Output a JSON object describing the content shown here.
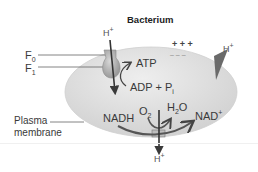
{
  "title": "Bacterium",
  "labels": {
    "f0": {
      "base": "F",
      "sub": "0"
    },
    "f1": {
      "base": "F",
      "sub": "1"
    },
    "plasma_membrane_line1": "Plasma",
    "plasma_membrane_line2": "membrane",
    "h_top": {
      "base": "H",
      "sup": "+"
    },
    "h_right": {
      "base": "H",
      "sup": "+"
    },
    "h_bottom": {
      "base": "H",
      "sup": "+"
    },
    "atp": "ATP",
    "adp_pi": {
      "base": "ADP + P",
      "sub": "i"
    },
    "nadh": "NADH",
    "o2": {
      "base": "O",
      "sub": "2"
    },
    "h2o": {
      "base": "H",
      "sub": "2",
      "tail": "O"
    },
    "nad": {
      "base": "NAD",
      "sup": "+"
    },
    "plus_charges": "+ + +",
    "minus_charges": "– – –"
  },
  "colors": {
    "cell_fill": "#dcdcdc",
    "cell_highlight": "#eeeeee",
    "arrow": "#3a3a3a",
    "protein": "#b5b5b5",
    "gradient_wedge": "#6a6a6a",
    "leader_line": "#666666"
  }
}
